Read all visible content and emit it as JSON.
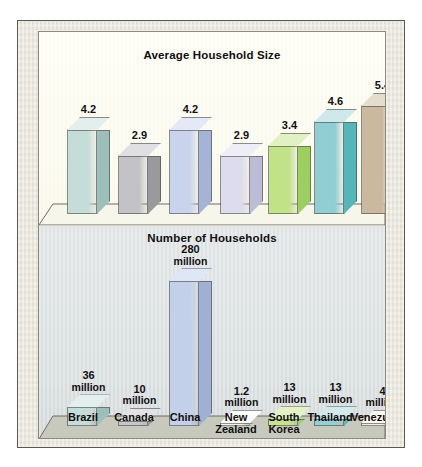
{
  "figure": {
    "background_color": "#ffffff",
    "mat_color": "#e9e6da",
    "panel_top_color": "#fdfcf0",
    "panel_bottom_color": "#dce1e2"
  },
  "chart_data": [
    {
      "type": "bar",
      "title": "Average Household Size",
      "xlabel": "",
      "ylabel": "",
      "ylim": [
        0,
        5.9
      ],
      "grid": false,
      "legend": "none",
      "categories": [
        "Brazil",
        "Canada",
        "China",
        "New Zealand",
        "South Korea",
        "Thailand",
        "Venezuela"
      ],
      "values": [
        4.2,
        2.9,
        4.2,
        2.9,
        3.4,
        4.6,
        5.4
      ],
      "value_labels": [
        "4.2",
        "2.9",
        "4.2",
        "2.9",
        "3.4",
        "4.6",
        "5.4"
      ],
      "colors": [
        "#c5ddd8",
        "#c3c3c5",
        "#c9d4ec",
        "#dcdcee",
        "#c2e288",
        "#8fcfd3",
        "#cbb99f"
      ],
      "side_colors": [
        "#9dbfba",
        "#9a9a9d",
        "#a5b4d6",
        "#bcbcd6",
        "#9ccf5f",
        "#54b6b9",
        "#ad9878"
      ],
      "top_colors": [
        "#e2efec",
        "#e0e0e2",
        "#e3e9f6",
        "#eeeef7",
        "#e0f1c2",
        "#cfe9ea",
        "#e6dccc"
      ]
    },
    {
      "type": "bar",
      "title": "Number of Households",
      "xlabel": "",
      "ylabel": "",
      "ylim": [
        0,
        300
      ],
      "grid": false,
      "legend": "none",
      "categories": [
        "Brazil",
        "Canada",
        "China",
        "New Zealand",
        "South Korea",
        "Thailand",
        "Venezuela"
      ],
      "values": [
        36,
        10,
        280,
        1.2,
        13,
        13,
        4
      ],
      "value_labels": [
        "36",
        "10",
        "280",
        "1.2",
        "13",
        "13",
        "4"
      ],
      "value_units": [
        "million",
        "million",
        "million",
        "million",
        "million",
        "million",
        "million"
      ],
      "colors": [
        "#c5ddd8",
        "#c6c6c8",
        "#c3d0ea",
        "#f4f4ee",
        "#c7e489",
        "#93d0d4",
        "#f3ece0"
      ],
      "side_colors": [
        "#9dbfba",
        "#9c9c9f",
        "#9fb0d4",
        "#d8d8cf",
        "#9ed162",
        "#58b8bb",
        "#d6cdbb"
      ],
      "top_colors": [
        "#e2efec",
        "#e3e3e5",
        "#dfe6f5",
        "#fcfcf8",
        "#e2f2c5",
        "#d2eaeb",
        "#fbf6ee"
      ]
    }
  ],
  "axis": {
    "categories": [
      "Brazil",
      "Canada",
      "China",
      "New\nZealand",
      "South\nKorea",
      "Thailand",
      "Venezuela"
    ]
  }
}
